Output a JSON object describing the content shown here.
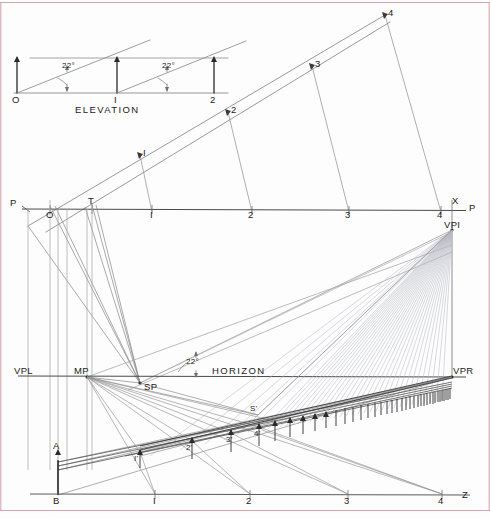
{
  "drawing": {
    "title": "Inclined Plane Perspective Construction",
    "width": 490,
    "height": 519,
    "background_color": "#fdfdfd",
    "line_color": "#2b2b2b",
    "light_line_color": "#9a9a9a",
    "faint_line_color": "#b9bcc4",
    "pink_border_color": "#d9a3ae"
  },
  "elevation": {
    "caption": "ELEVATION",
    "angle_label_1": "22°",
    "angle_label_2": "22°",
    "base_labels": [
      "O",
      "I",
      "2"
    ],
    "baseline_y": 93,
    "top_y": 58,
    "stations_x": [
      17,
      117,
      214
    ]
  },
  "picture_plane": {
    "line_y": 209,
    "left_label": "P",
    "right_label": "P",
    "x_label": "X",
    "station_labels": [
      "O",
      "T",
      "I",
      "2",
      "3",
      "4"
    ],
    "station_x": [
      50,
      92,
      152,
      252,
      349,
      441
    ],
    "left_label_x": 15,
    "right_label_x": 472,
    "x_label_x": 452
  },
  "horizon": {
    "line_y": 376,
    "label": "HORIZON",
    "vpl_label": "VPL",
    "vpl_x": 28,
    "mp_label": "MP",
    "mp_x": 87,
    "sp_label": "SP",
    "sp_x": 140,
    "sp_y": 383,
    "vpr_label": "VPR",
    "vpr_x": 452,
    "vpi_label": "VPI",
    "vpi_y": 230,
    "angle_label": "22°"
  },
  "ground": {
    "line_y": 494,
    "origin_label": "B",
    "origin_x": 58,
    "z_label": "Z",
    "z_x": 465,
    "station_labels": [
      "I",
      "2",
      "3",
      "4"
    ],
    "station_x": [
      155,
      250,
      348,
      442
    ],
    "a_label": "A",
    "a_x": 58,
    "a_y": 462
  },
  "perspective_risers": {
    "labels": [
      "I'",
      "2'",
      "3'",
      "4'",
      "S'"
    ],
    "x": [
      140,
      192,
      231,
      259,
      258
    ],
    "y": [
      452,
      441,
      433,
      427,
      415
    ]
  },
  "inclined_plane": {
    "apex_label": "4",
    "apex_x": 385,
    "apex_y": 15,
    "rung_labels": [
      "I",
      "2",
      "3",
      "4"
    ],
    "rung_x": [
      140,
      228,
      312,
      385
    ],
    "rung_y": [
      155,
      112,
      66,
      15
    ],
    "angle_label": "22°"
  }
}
